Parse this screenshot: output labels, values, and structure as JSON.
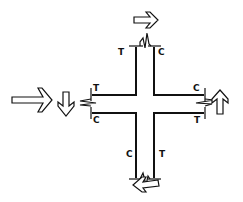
{
  "diagram": {
    "colors": {
      "ink": "#111111",
      "background": "#ffffff"
    },
    "labels": {
      "top_left": "T",
      "top_right": "C",
      "left_top": "T",
      "left_bottom": "C",
      "right_top": "C",
      "right_bottom": "T",
      "bottom_left": "C",
      "bottom_right": "T"
    },
    "arrows": [
      {
        "position": "top",
        "direction": "right"
      },
      {
        "position": "left-outer",
        "direction": "right"
      },
      {
        "position": "left-inner",
        "direction": "down"
      },
      {
        "position": "right",
        "direction": "up"
      },
      {
        "position": "bottom",
        "direction": "left"
      }
    ]
  }
}
